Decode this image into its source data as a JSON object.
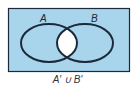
{
  "diagram": {
    "set_a_label": "A",
    "set_b_label": "B",
    "caption": "A′ ∪ B′",
    "fill_color": "#a8d4ec",
    "outline_color": "#1a2a3a",
    "intersection_color": "#ffffff"
  }
}
